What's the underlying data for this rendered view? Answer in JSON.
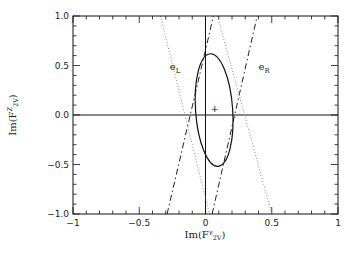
{
  "chart_data": {
    "type": "line",
    "title": "",
    "xlabel": "Im(F^γ_2V)",
    "ylabel": "Im(F^Z_2V)",
    "xlabel_parts": {
      "base": "Im(F",
      "sup": "γ",
      "sub": "2V",
      "close": ")"
    },
    "ylabel_parts": {
      "base": "Im(F",
      "sup": "Z",
      "sub": "2V",
      "close": ")"
    },
    "xlim": [
      -1,
      1
    ],
    "ylim": [
      -1,
      1
    ],
    "x_ticks": [
      -1,
      -0.5,
      0,
      0.5,
      1
    ],
    "x_tick_labels": [
      "-1",
      "-0.5",
      "0",
      "0.5",
      "1"
    ],
    "y_ticks": [
      -1,
      -0.5,
      0,
      0.5,
      1
    ],
    "y_tick_labels": [
      "-1.0",
      "-0.5",
      "0.0",
      "0.5",
      "1.0"
    ],
    "minor_tick_step": 0.1,
    "grid": false,
    "reference_lines": [
      {
        "orientation": "vertical",
        "value": 0
      },
      {
        "orientation": "horizontal",
        "value": 0
      }
    ],
    "series": [
      {
        "name": "e_L dash-dot bound",
        "style": "dash-dot",
        "points": [
          [
            -0.29,
            -1.0
          ],
          [
            0.06,
            1.0
          ]
        ]
      },
      {
        "name": "e_R dash-dot bound",
        "style": "dash-dot",
        "points": [
          [
            0.05,
            -1.0
          ],
          [
            0.39,
            1.0
          ]
        ]
      },
      {
        "name": "dotted bound 1",
        "style": "dotted",
        "points": [
          [
            -0.34,
            1.0
          ],
          [
            0.03,
            -1.0
          ]
        ]
      },
      {
        "name": "dotted bound 2",
        "style": "dotted",
        "points": [
          [
            0.09,
            1.0
          ],
          [
            0.5,
            -1.0
          ]
        ]
      }
    ],
    "ellipse": {
      "center": [
        0.065,
        0.05
      ],
      "semi_x": 0.14,
      "semi_y": 0.57,
      "rotation_deg": -4,
      "style": "solid"
    },
    "marker": {
      "symbol": "+",
      "x": 0.07,
      "y": 0.07
    },
    "annotations": [
      {
        "text": "e",
        "sub": "L",
        "x": -0.27,
        "y": 0.45
      },
      {
        "text": "e",
        "sub": "R",
        "x": 0.4,
        "y": 0.45
      }
    ]
  }
}
